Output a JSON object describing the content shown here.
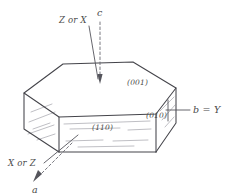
{
  "figure": {
    "background_color": "#ffffff",
    "ink_color": "#44444a",
    "striation_color": "#a9a9b0",
    "faces": [
      {
        "id": "top",
        "label": "(001)",
        "name": "face-label-001"
      },
      {
        "id": "front",
        "label": "(110)",
        "name": "face-label-110"
      },
      {
        "id": "right-end",
        "label": "(010)",
        "name": "face-label-010"
      }
    ],
    "axes": [
      {
        "id": "c",
        "label": "c",
        "style": "dashed",
        "direction": "vertical-down"
      },
      {
        "id": "b",
        "label": "b = Y",
        "style": "solid",
        "direction": "right"
      },
      {
        "id": "a",
        "label": "a",
        "style": "dashed",
        "direction": "down-left"
      }
    ],
    "optic_labels": [
      {
        "id": "top-optic",
        "label": "Z or X",
        "name": "optic-label-z-or-x"
      },
      {
        "id": "front-optic",
        "label": "X or Z",
        "name": "optic-label-x-or-z"
      }
    ]
  }
}
